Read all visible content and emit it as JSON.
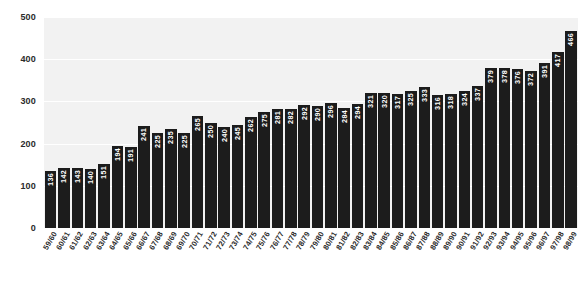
{
  "chart_data": {
    "type": "bar",
    "title": "",
    "subtitle": "",
    "xlabel": "",
    "ylabel": "",
    "ylim": [
      0,
      500
    ],
    "yticks": [
      0,
      100,
      200,
      300,
      400,
      500
    ],
    "grid": true,
    "legend": null,
    "categories": [
      "59/60",
      "60/61",
      "61/62",
      "62/63",
      "63/64",
      "64/65",
      "65/66",
      "66/67",
      "67/68",
      "68/69",
      "69/70",
      "70/71",
      "71/72",
      "72/73",
      "73/74",
      "74/75",
      "75/76",
      "76/77",
      "77/78",
      "78/79",
      "79/80",
      "80/81",
      "81/82",
      "82/83",
      "83/84",
      "84/85",
      "85/86",
      "86/87",
      "87/88",
      "88/89",
      "89/90",
      "90/91",
      "91/92",
      "92/93",
      "93/94",
      "94/95",
      "95/96",
      "96/97",
      "97/98",
      "98/99"
    ],
    "values": [
      136,
      142,
      143,
      140,
      151,
      194,
      191,
      241,
      225,
      235,
      225,
      265,
      250,
      240,
      245,
      262,
      275,
      281,
      282,
      292,
      290,
      296,
      284,
      294,
      321,
      320,
      317,
      325,
      333,
      316,
      318,
      324,
      337,
      379,
      378,
      376,
      372,
      391,
      417,
      466
    ],
    "colors": {
      "bar": "#1c1c1c",
      "bar_label": "#ffffff",
      "plot_background": "#f2f2f2",
      "gridline": "#ffffff",
      "axis_text": "#2b2b2b",
      "page_background": "#ffffff"
    }
  }
}
